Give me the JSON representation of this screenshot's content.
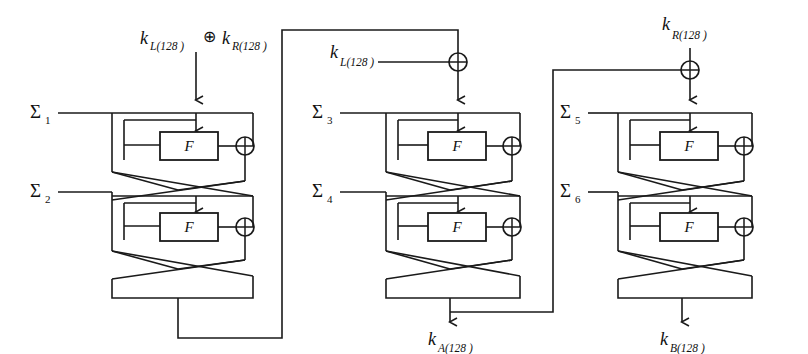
{
  "diagram": {
    "type": "feistel-key-schedule",
    "function_box_label": "F",
    "xor_symbol": "⊕",
    "line_color": "#1a1a1a",
    "background_color": "#ffffff"
  },
  "inputs": {
    "top_left": {
      "left_key": "k",
      "left_key_sub": "L(128 )",
      "operator": "⊕",
      "right_key": "k",
      "right_key_sub": "R(128 )",
      "full_text": "k L(128 ) ⊕ k R(128 )"
    },
    "middle_key": {
      "symbol": "k",
      "subscript": "L(128 )",
      "full_text": "kL(128 )"
    },
    "right_key": {
      "symbol": "k",
      "subscript": "R(128 )",
      "full_text": "kR(128 )"
    }
  },
  "outputs": {
    "middle": {
      "symbol": "k",
      "subscript": "A(128 )",
      "full_text": "kA(128 )"
    },
    "right": {
      "symbol": "k",
      "subscript": "B(128 )",
      "full_text": "kB(128 )"
    }
  },
  "blocks": [
    {
      "id": "block-1",
      "name": "first-feistel-block",
      "rounds": [
        {
          "constant_symbol": "Σ",
          "constant_index": "1",
          "function_label": "F"
        },
        {
          "constant_symbol": "Σ",
          "constant_index": "2",
          "function_label": "F"
        }
      ]
    },
    {
      "id": "block-2",
      "name": "second-feistel-block",
      "rounds": [
        {
          "constant_symbol": "Σ",
          "constant_index": "3",
          "function_label": "F"
        },
        {
          "constant_symbol": "Σ",
          "constant_index": "4",
          "function_label": "F"
        }
      ]
    },
    {
      "id": "block-3",
      "name": "third-feistel-block",
      "rounds": [
        {
          "constant_symbol": "Σ",
          "constant_index": "5",
          "function_label": "F"
        },
        {
          "constant_symbol": "Σ",
          "constant_index": "6",
          "function_label": "F"
        }
      ]
    }
  ]
}
